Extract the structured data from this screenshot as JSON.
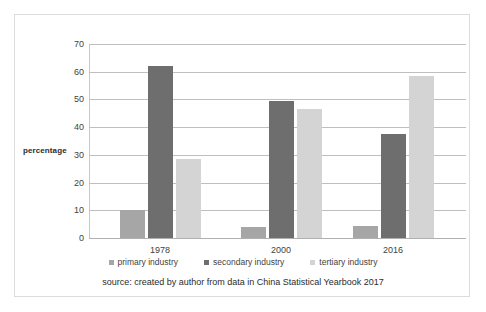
{
  "chart_data": {
    "type": "bar",
    "title": "",
    "xlabel": "",
    "ylabel": "percentage",
    "categories": [
      "1978",
      "2000",
      "2016"
    ],
    "series": [
      {
        "name": "primary industry",
        "values": [
          10,
          4,
          4.5
        ],
        "color": "#a6a6a6"
      },
      {
        "name": "secondary industry",
        "values": [
          62,
          49.5,
          37.5
        ],
        "color": "#6e6e6e"
      },
      {
        "name": "tertiary industry",
        "values": [
          28.5,
          46.5,
          58.5
        ],
        "color": "#d4d4d4"
      }
    ],
    "ylim": [
      0,
      70
    ],
    "yticks": [
      "0",
      "10",
      "20",
      "30",
      "40",
      "50",
      "60",
      "70"
    ],
    "grid": true,
    "legend_position": "bottom",
    "caption": "source: created by author from data in China Statistical Yearbook 2017"
  }
}
